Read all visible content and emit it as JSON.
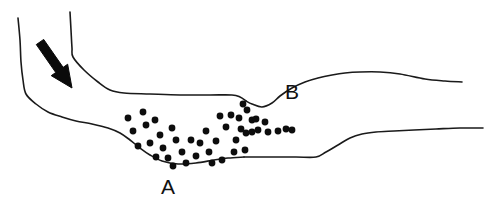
{
  "figure": {
    "background_color": "#ffffff",
    "line_color": "#1a1a1a",
    "dot_color": "#0d0d0d",
    "arrow_color": "#0a0a0a",
    "width": 501,
    "height": 215
  },
  "labels": [
    {
      "id": "A",
      "text": "A",
      "x": 168,
      "y": 188,
      "font_size": 21
    },
    {
      "id": "B",
      "text": "B",
      "x": 292,
      "y": 93,
      "font_size": 21
    }
  ],
  "arrow": {
    "name": "flow-direction-arrow",
    "from_x": 40,
    "from_y": 42,
    "to_x": 72,
    "to_y": 88,
    "shaft_width": 9,
    "head_length": 22,
    "head_width": 20
  },
  "boundaries": [
    {
      "id": "upper-bank-line",
      "label": "upper bank outline",
      "points": "70,12 71,30 72,48 73,57 84,70 98,82 110,90 124,93 150,94 180,95 210,95 232,95 240,97 246,101"
    },
    {
      "id": "upper-bank-right-line",
      "label": "upper bank outline right of B notch",
      "points": "246,101 252,104 262,107 272,103 280,96 292,88 305,82 318,78 332,75 345,73 360,72 380,72 400,74 425,79 445,81 462,82"
    },
    {
      "id": "lower-bank-left-line",
      "label": "lower bank outline left segment",
      "points": "18,18 20,40 21,62 23,80 26,94 36,104 48,112 62,117 76,121 92,124 108,128 120,133 130,140 140,148 150,155 162,161 178,164 196,163 214,160 228,158 244,157"
    },
    {
      "id": "lower-bank-right-line",
      "label": "lower bank outline right segment",
      "points": "244,157 270,157 296,157 316,157 326,152 338,145 350,138 362,134 376,132 394,131 414,130 436,129 460,128 483,128"
    }
  ],
  "dots": {
    "name": "point-feature-scatter",
    "radius": 3.4,
    "count": 44,
    "points": [
      [
        128,
        118
      ],
      [
        143,
        112
      ],
      [
        146,
        125
      ],
      [
        133,
        131
      ],
      [
        155,
        120
      ],
      [
        160,
        135
      ],
      [
        150,
        143
      ],
      [
        138,
        146
      ],
      [
        163,
        148
      ],
      [
        172,
        128
      ],
      [
        176,
        140
      ],
      [
        182,
        152
      ],
      [
        168,
        158
      ],
      [
        156,
        157
      ],
      [
        186,
        163
      ],
      [
        173,
        166
      ],
      [
        196,
        156
      ],
      [
        191,
        140
      ],
      [
        200,
        143
      ],
      [
        206,
        131
      ],
      [
        209,
        152
      ],
      [
        216,
        141
      ],
      [
        222,
        160
      ],
      [
        212,
        163
      ],
      [
        226,
        127
      ],
      [
        231,
        115
      ],
      [
        236,
        140
      ],
      [
        241,
        129
      ],
      [
        234,
        152
      ],
      [
        245,
        150
      ],
      [
        243,
        104
      ],
      [
        247,
        110
      ],
      [
        239,
        118
      ],
      [
        252,
        120
      ],
      [
        256,
        119
      ],
      [
        258,
        130
      ],
      [
        246,
        133
      ],
      [
        252,
        132
      ],
      [
        265,
        122
      ],
      [
        268,
        132
      ],
      [
        278,
        131
      ],
      [
        286,
        129
      ],
      [
        292,
        130
      ],
      [
        220,
        116
      ]
    ]
  }
}
